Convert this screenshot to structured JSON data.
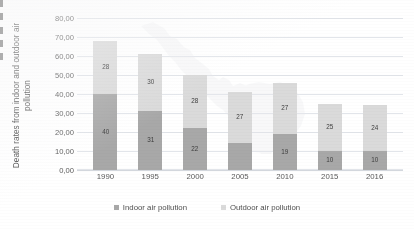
{
  "chart_data": {
    "type": "bar",
    "subtype": "stacked-bar",
    "title": "",
    "xlabel": "",
    "ylabel": "Death rates from indoor and outdoor air pollution",
    "ylabel_line1": "Death rates from indoor and outdoor air",
    "ylabel_line2": "pollution",
    "categories": [
      "1990",
      "1995",
      "2000",
      "2005",
      "2010",
      "2015",
      "2016"
    ],
    "series": [
      {
        "name": "Indoor air pollution",
        "color": "#a8a8a8",
        "values": [
          40,
          31,
          22,
          14,
          19,
          10,
          10
        ],
        "labels": [
          "40",
          "31",
          "22",
          "",
          "19",
          "10",
          "10"
        ]
      },
      {
        "name": "Outdoor air pollution",
        "color": "#dadada",
        "values": [
          28,
          30,
          28,
          27,
          27,
          25,
          24
        ],
        "labels": [
          "28",
          "30",
          "28",
          "27",
          "27",
          "25",
          "24"
        ]
      }
    ],
    "totals": [
      68,
      61,
      50,
      41,
      46,
      35,
      34
    ],
    "ylim": [
      0,
      80
    ],
    "ytick_step": 10,
    "ytick_labels": [
      "80,00",
      "70,00",
      "60,00",
      "50,00",
      "40,00",
      "30,00",
      "20,00",
      "10,00",
      "0,00"
    ],
    "ytick_values": [
      80,
      70,
      60,
      50,
      40,
      30,
      20,
      10,
      0
    ],
    "grid": true,
    "grid_axis": "y",
    "legend_position": "bottom",
    "background_watermark": "latin-america-map"
  },
  "legend": {
    "items": [
      {
        "label": "Indoor air pollution",
        "swatch": "indoor-swatch-icon"
      },
      {
        "label": "Outdoor air pollution",
        "swatch": "outdoor-swatch-icon"
      }
    ]
  }
}
